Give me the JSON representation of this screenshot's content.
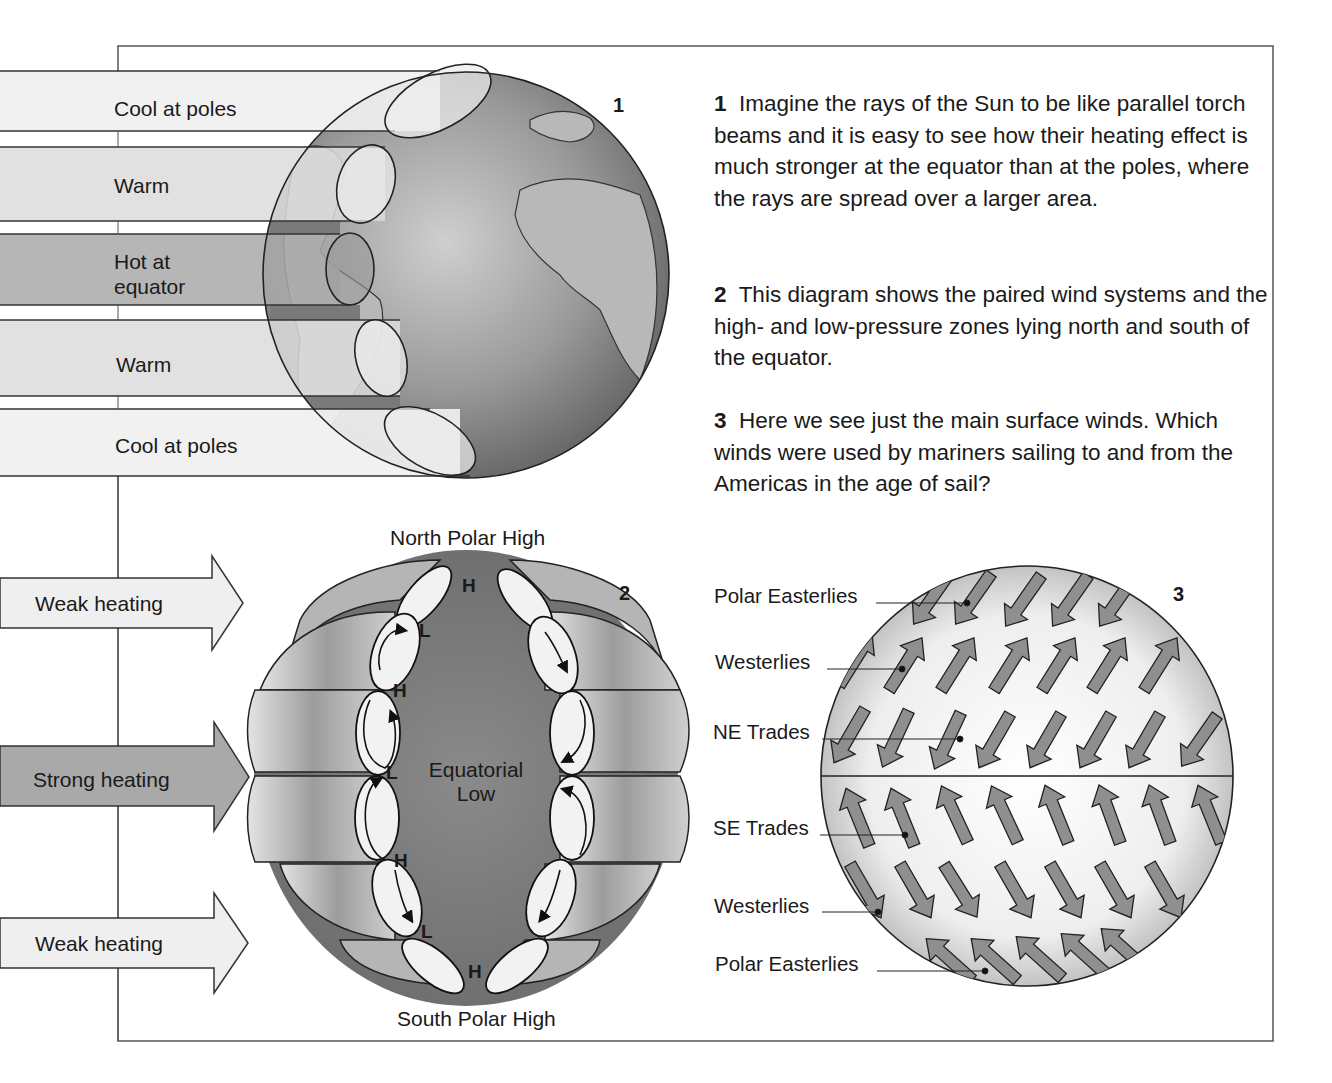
{
  "figure1": {
    "number": "1",
    "bands": [
      {
        "label": "Cool at poles",
        "shade": "#f0f0f0"
      },
      {
        "label": "Warm",
        "shade": "#dcdcdc"
      },
      {
        "label_line1": "Hot at",
        "label_line2": "equator",
        "shade": "#a9a9a9"
      },
      {
        "label": "Warm",
        "shade": "#dcdcdc"
      },
      {
        "label": "Cool at poles",
        "shade": "#f0f0f0"
      }
    ]
  },
  "text": {
    "para1": {
      "num": "1",
      "body": "Imagine the rays of the Sun to be like parallel torch beams and it is easy to see how their heating effect is much stronger at the equator than at the poles, where the rays are spread over a larger area."
    },
    "para2": {
      "num": "2",
      "body": "This diagram shows the paired wind systems and the high- and low-pressure zones lying north and south of the equator."
    },
    "para3": {
      "num": "3",
      "body": "Here we see just the main surface winds. Which winds were used by mariners sailing to and from the Americas in the age of sail?"
    }
  },
  "figure2": {
    "number": "2",
    "top_caption": "North Polar High",
    "bottom_caption": "South Polar High",
    "center_label_line1": "Equatorial",
    "center_label_line2": "Low",
    "heating_arrows": [
      {
        "label": "Weak heating",
        "shade": "#efefef"
      },
      {
        "label": "Strong heating",
        "shade": "#a9a9a9"
      },
      {
        "label": "Weak heating",
        "shade": "#efefef"
      }
    ],
    "pressure_labels": [
      "H",
      "L",
      "H",
      "L",
      "H",
      "L",
      "H"
    ]
  },
  "figure3": {
    "number": "3",
    "wind_labels": [
      "Polar Easterlies",
      "Westerlies",
      "NE Trades",
      "SE Trades",
      "Westerlies",
      "Polar Easterlies"
    ]
  },
  "colors": {
    "ink": "#1a1a1a",
    "globe_dark": "#6e6e6e",
    "globe_light": "#d8d8d8",
    "arrow_fill": "#8f8f8f"
  }
}
